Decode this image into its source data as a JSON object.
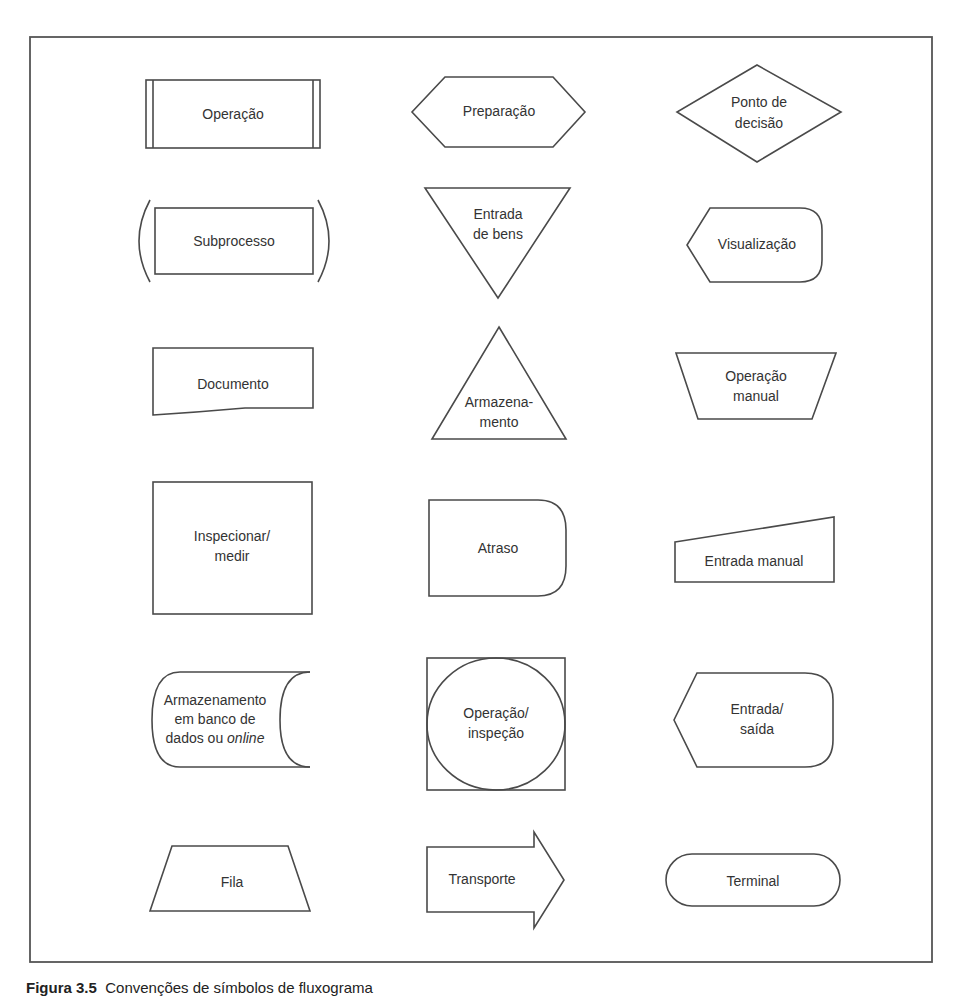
{
  "figure": {
    "caption_label": "Figura 3.5",
    "caption_text": "Convenções de símbolos de fluxograma"
  },
  "symbols": {
    "operacao": {
      "lines": [
        "Operação"
      ]
    },
    "preparacao": {
      "lines": [
        "Preparação"
      ]
    },
    "ponto_decisao": {
      "lines": [
        "Ponto de",
        "decisão"
      ]
    },
    "subprocesso": {
      "lines": [
        "Subprocesso"
      ]
    },
    "entrada_bens": {
      "lines": [
        "Entrada",
        "de bens"
      ]
    },
    "visualizacao": {
      "lines": [
        "Visualização"
      ]
    },
    "documento": {
      "lines": [
        "Documento"
      ]
    },
    "armazenamento": {
      "lines": [
        "Armazena-",
        "mento"
      ]
    },
    "operacao_manual": {
      "lines": [
        "Operação",
        "manual"
      ]
    },
    "inspecionar": {
      "lines": [
        "Inspecionar/",
        "medir"
      ]
    },
    "atraso": {
      "lines": [
        "Atraso"
      ]
    },
    "entrada_manual": {
      "lines": [
        "Entrada manual"
      ]
    },
    "armazenamento_db": {
      "lines": [
        "Armazenamento",
        "em banco de",
        "dados ou ",
        "online"
      ]
    },
    "operacao_inspecao": {
      "lines": [
        "Operação/",
        "inspeção"
      ]
    },
    "entrada_saida": {
      "lines": [
        "Entrada/",
        "saída"
      ]
    },
    "fila": {
      "lines": [
        "Fila"
      ]
    },
    "transporte": {
      "lines": [
        "Transporte"
      ]
    },
    "terminal": {
      "lines": [
        "Terminal"
      ]
    }
  },
  "colors": {
    "stroke": "#4a4a4a",
    "text": "#333333",
    "background": "#ffffff"
  }
}
